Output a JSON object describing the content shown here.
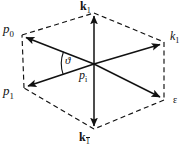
{
  "figure": {
    "background": "#ffffff",
    "stroke_color": "#111111",
    "labels": {
      "p0": "p",
      "p0_sub": "0",
      "k1_top_vec": "k",
      "k1_top_sub": "1",
      "k1_right": "k",
      "k1_right_sub": "1",
      "p1": "p",
      "p1_sub": "1",
      "pi": "p",
      "pi_sub": "i",
      "epsilon": "ε",
      "k1_bot_vec": "k",
      "k1_bot_sub": "1",
      "theta": "ϑ"
    }
  },
  "geometry": {
    "center": {
      "x": 94,
      "y": 64
    },
    "vertices": [
      {
        "name": "p0",
        "x": 22,
        "y": 35
      },
      {
        "name": "k1-top",
        "x": 94,
        "y": 13
      },
      {
        "name": "k1",
        "x": 164,
        "y": 42
      },
      {
        "name": "epsilon",
        "x": 164,
        "y": 100
      },
      {
        "name": "k1-bot",
        "x": 94,
        "y": 129
      },
      {
        "name": "p1",
        "x": 24,
        "y": 88
      }
    ],
    "dashed_outline": "hexagon",
    "solid_arrows": [
      {
        "from": "center",
        "to": "p0"
      },
      {
        "from": "center",
        "to": "k1-top"
      },
      {
        "from": "center",
        "to": "k1"
      },
      {
        "from": "center",
        "to": "epsilon"
      },
      {
        "from": "center",
        "to": "k1-bot"
      },
      {
        "from": "center",
        "to": "p1"
      }
    ],
    "angle_arc": {
      "between": [
        "p0",
        "p1"
      ],
      "label": "ϑ",
      "radius": 32
    }
  }
}
